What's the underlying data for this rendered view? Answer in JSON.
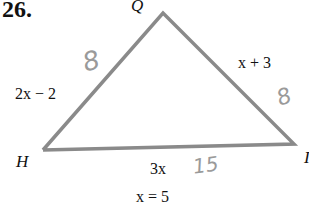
{
  "problem": {
    "number": "26.",
    "vertices": {
      "top": "Q",
      "left": "H",
      "right": "I"
    },
    "sides": {
      "HQ": {
        "expression": "2x − 2",
        "handwritten_value": "8"
      },
      "QI": {
        "expression": "x + 3",
        "handwritten_value": "8"
      },
      "HI": {
        "expression": "3x",
        "handwritten_value": "15"
      }
    },
    "solution": "x = 5"
  },
  "colors": {
    "triangle_stroke": "#8a8a8a",
    "text": "#111111",
    "handwriting": "#9a9a9a"
  }
}
